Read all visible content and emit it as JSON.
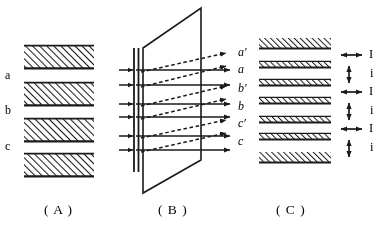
{
  "figure": {
    "background_color": "#ffffff",
    "ink_color": "#1a1a1a",
    "panels": [
      {
        "id": "A",
        "caption": "( A )",
        "caption_x": 44,
        "caption_y": 209,
        "description": "stack-of-hatched-layers",
        "layer_labels": [
          {
            "text": "a",
            "x": 5,
            "y": 75
          },
          {
            "text": "b",
            "x": 5,
            "y": 110
          },
          {
            "text": "c",
            "x": 5,
            "y": 145
          }
        ],
        "bars": [
          {
            "x": 24,
            "y": 45,
            "width": 70,
            "height": 24
          },
          {
            "x": 24,
            "y": 82,
            "width": 70,
            "height": 24
          },
          {
            "x": 24,
            "y": 118,
            "width": 70,
            "height": 24
          },
          {
            "x": 24,
            "y": 153,
            "width": 70,
            "height": 24
          }
        ]
      },
      {
        "id": "B",
        "caption": "( B )",
        "caption_x": 158,
        "caption_y": 209,
        "description": "rays-incident-on-tilted-plane",
        "plane": {
          "points": "143,48 201,8 201,160 143,193"
        },
        "slit": {
          "x1": 134,
          "x2": 138,
          "y_top": 48,
          "y_bottom": 172
        },
        "ray_labels": [
          {
            "text": "a′",
            "x": 238,
            "y": 52
          },
          {
            "text": "a",
            "x": 238,
            "y": 69
          },
          {
            "text": "b′",
            "x": 238,
            "y": 88
          },
          {
            "text": "b",
            "x": 238,
            "y": 106
          },
          {
            "text": "c′",
            "x": 238,
            "y": 123
          },
          {
            "text": "c",
            "x": 238,
            "y": 141
          }
        ],
        "solid_rays_y": [
          70,
          85,
          104,
          117,
          136,
          150
        ],
        "dashed_rays": [
          {
            "x1": 141,
            "y1": 72,
            "x2": 226,
            "y2": 53
          },
          {
            "x1": 141,
            "y1": 87,
            "x2": 226,
            "y2": 66
          },
          {
            "x1": 141,
            "y1": 106,
            "x2": 226,
            "y2": 86
          },
          {
            "x1": 141,
            "y1": 119,
            "x2": 226,
            "y2": 99
          },
          {
            "x1": 141,
            "y1": 138,
            "x2": 226,
            "y2": 120
          },
          {
            "x1": 141,
            "y1": 152,
            "x2": 226,
            "y2": 133
          }
        ],
        "incoming_arrows_y": [
          70,
          85,
          104,
          117,
          136,
          150
        ]
      },
      {
        "id": "C",
        "caption": "( C )",
        "caption_x": 276,
        "caption_y": 209,
        "description": "layer-stack-with-spacing-arrows",
        "bars": [
          {
            "x": 259,
            "y": 38,
            "width": 72,
            "height": 11,
            "kind": "thick"
          },
          {
            "x": 259,
            "y": 61,
            "width": 72,
            "height": 7,
            "kind": "thin"
          },
          {
            "x": 259,
            "y": 79,
            "width": 72,
            "height": 7,
            "kind": "thin"
          },
          {
            "x": 259,
            "y": 97,
            "width": 72,
            "height": 7,
            "kind": "thin"
          },
          {
            "x": 259,
            "y": 116,
            "width": 72,
            "height": 7,
            "kind": "thin"
          },
          {
            "x": 259,
            "y": 133,
            "width": 72,
            "height": 7,
            "kind": "thin"
          },
          {
            "x": 259,
            "y": 152,
            "width": 72,
            "height": 11,
            "kind": "thick"
          }
        ],
        "measure_marks": [
          {
            "label": "I",
            "type": "horizontal-double-arrow",
            "y": 55,
            "x1": 340,
            "x2": 362,
            "label_x": 370,
            "label_y": 50
          },
          {
            "label": "i",
            "type": "vertical-double-arrow",
            "y": 74,
            "x": 348,
            "y1": 66,
            "y2": 82,
            "label_x": 370,
            "label_y": 69
          },
          {
            "label": "I",
            "type": "horizontal-double-arrow",
            "y": 92,
            "x1": 340,
            "x2": 362,
            "label_x": 370,
            "label_y": 87
          },
          {
            "label": "i",
            "type": "vertical-double-arrow",
            "y": 111,
            "x": 348,
            "y1": 103,
            "y2": 119,
            "label_x": 370,
            "label_y": 106
          },
          {
            "label": "I",
            "type": "horizontal-double-arrow",
            "y": 129,
            "x1": 340,
            "x2": 362,
            "label_x": 370,
            "label_y": 124
          },
          {
            "label": "i",
            "type": "vertical-double-arrow",
            "y": 148,
            "x": 348,
            "y1": 140,
            "y2": 156,
            "label_x": 370,
            "label_y": 143
          }
        ]
      }
    ]
  }
}
